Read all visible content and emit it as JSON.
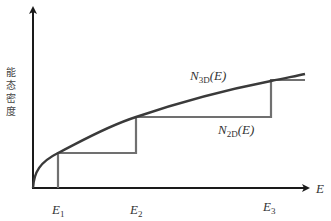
{
  "diagram": {
    "y_axis_label_chars": [
      "能",
      "态",
      "密",
      "度"
    ],
    "x_axis_label": "E",
    "curves": {
      "n3d": {
        "label_main": "N",
        "label_sub": "3D",
        "label_arg": "(E)",
        "color": "#3a3a3a"
      },
      "n2d": {
        "label_main": "N",
        "label_sub": "2D",
        "label_arg": "(E)",
        "color": "#707070"
      }
    },
    "energy_levels": [
      {
        "main": "E",
        "sub": "1"
      },
      {
        "main": "E",
        "sub": "2"
      },
      {
        "main": "E",
        "sub": "3"
      }
    ],
    "axis_color": "#1a1a1a"
  }
}
